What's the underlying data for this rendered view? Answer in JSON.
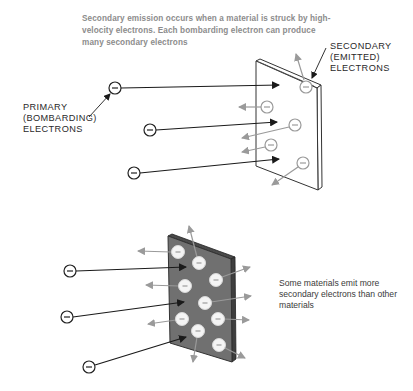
{
  "caption_top": "Secondary emission occurs when a material is struck by high-velocity electrons.  Each bombarding electron can produce many secondary electrons",
  "labels": {
    "secondary": [
      "SECONDARY",
      "(EMITTED)",
      "ELECTRONS"
    ],
    "primary": [
      "PRIMARY",
      "(BOMBARDING)",
      "ELECTRONS"
    ]
  },
  "caption_bottom": "Some materials emit more secondary electrons than other materials",
  "electron_symbol": "−",
  "colors": {
    "caption_text": "#8c8c8c",
    "label_text": "#2a2a2a",
    "primary_arrow": "#1a1a1a",
    "secondary_arrow": "#9a9a9a",
    "plate_light": "#ffffff",
    "plate_dark": "#6e6e6e"
  },
  "top_diagram": {
    "primary_electron_count": 3,
    "secondary_electron_count": 5
  },
  "bottom_diagram": {
    "primary_electron_count": 3,
    "secondary_electron_count": 9
  }
}
